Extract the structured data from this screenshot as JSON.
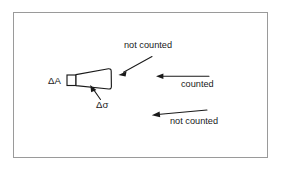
{
  "figure": {
    "name": "solid-angle-counting-diagram",
    "frame": {
      "border_color": "#9a9a9a",
      "background": "#ffffff"
    },
    "ink_color": "#1a1a1a",
    "labels": {
      "delta_a": "ΔA",
      "delta_sigma": "Δσ",
      "not_counted_top": "not counted",
      "counted": "counted",
      "not_counted_bottom": "not counted"
    },
    "annotations": [
      {
        "id": "not-counted-top",
        "text": "not counted",
        "text_x": 124,
        "text_y": 48,
        "arrow_from_x": 152,
        "arrow_from_y": 57,
        "arrow_to_x": 120,
        "arrow_to_y": 74,
        "direction": "down-left"
      },
      {
        "id": "counted",
        "text": "counted",
        "text_x": 182,
        "text_y": 86,
        "arrow_from_x": 209,
        "arrow_from_y": 76,
        "arrow_to_x": 157,
        "arrow_to_y": 76,
        "direction": "left"
      },
      {
        "id": "not-counted-bottom",
        "text": "not counted",
        "text_x": 170,
        "text_y": 124,
        "arrow_from_x": 206,
        "arrow_from_y": 110,
        "arrow_to_x": 152,
        "arrow_to_y": 116,
        "direction": "left"
      },
      {
        "id": "delta-sigma",
        "text": "Δσ",
        "text_x": 96,
        "text_y": 105,
        "arrow_from_x": 100,
        "arrow_from_y": 99,
        "arrow_to_x": 91,
        "arrow_to_y": 87,
        "direction": "up-left"
      },
      {
        "id": "delta-a",
        "text": "ΔA",
        "text_x": 49,
        "text_y": 83,
        "direction": "none"
      }
    ],
    "geometry": {
      "patch_rect": {
        "x": 67,
        "y": 75,
        "width": 9,
        "height": 10
      },
      "cone_points": "76,74 110,69 111,89 76,86",
      "description": "small area element ΔA at apex opening into a truncated cone subtending solid angle Δσ"
    }
  }
}
